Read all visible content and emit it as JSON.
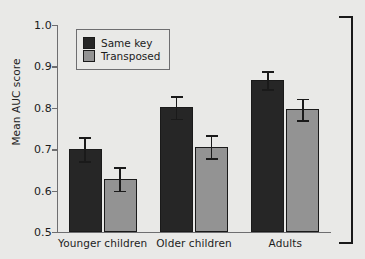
{
  "chart_data": {
    "type": "bar",
    "title": "",
    "xlabel": "",
    "ylabel": "Mean AUC score",
    "ylim": [
      0.5,
      1.0
    ],
    "yticks": [
      "0.5",
      "0.6",
      "0.7",
      "0.8",
      "0.9",
      "1.0"
    ],
    "ytick_values": [
      0.5,
      0.6,
      0.7,
      0.8,
      0.9,
      1.0
    ],
    "grid": false,
    "legend_position": "top-left",
    "categories": [
      "Younger children",
      "Older children",
      "Adults"
    ],
    "series": [
      {
        "name": "Same key",
        "color": "#262626",
        "values": [
          0.7,
          0.801,
          0.867
        ],
        "errors": [
          0.029,
          0.027,
          0.022
        ]
      },
      {
        "name": "Transposed",
        "color": "#939393",
        "values": [
          0.628,
          0.706,
          0.796
        ],
        "errors": [
          0.028,
          0.028,
          0.026
        ]
      }
    ]
  },
  "legend": {
    "items": [
      {
        "label": "Same key",
        "swatch": "dark"
      },
      {
        "label": "Transposed",
        "swatch": "light"
      }
    ]
  },
  "annotations": {
    "right_bracket": "figure-grouping-bracket"
  },
  "colors": {
    "background": "#e9e9e7",
    "axis": "#6e6e70",
    "text": "#1c1c1c",
    "dark_bar": "#262626",
    "light_bar": "#939393",
    "error_bar": "#1a1a1a"
  }
}
